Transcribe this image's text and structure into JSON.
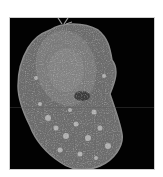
{
  "image": {
    "subject": "electron micrograph of a single cell",
    "background_color": "#ffffff",
    "panel_color": "#020202",
    "cell_colors": {
      "membrane": "#8a8a8a",
      "cytoplasm": "#6e6e6e",
      "nucleus": "#7d7d7d",
      "vesicles": "#bdbdbd",
      "dark_region": "#3e3e3e"
    }
  }
}
